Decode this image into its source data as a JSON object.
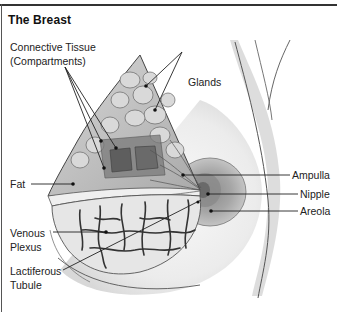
{
  "diagram": {
    "title": "The Breast",
    "labels": {
      "connective_tissue_line1": "Connective Tissue",
      "connective_tissue_line2": "(Compartments)",
      "glands": "Glands",
      "fat": "Fat",
      "venous_line1": "Venous",
      "venous_line2": "Plexus",
      "lactiferous_line1": "Lactiferous",
      "lactiferous_line2": "Tubule",
      "ampulla": "Ampulla",
      "nipple": "Nipple",
      "areola": "Areola"
    },
    "colors": {
      "background": "#ffffff",
      "text": "#222222",
      "shading": "#bdbdbd",
      "tissue_dark": "#6e6e6e",
      "areola": "#9a9a9a"
    }
  }
}
